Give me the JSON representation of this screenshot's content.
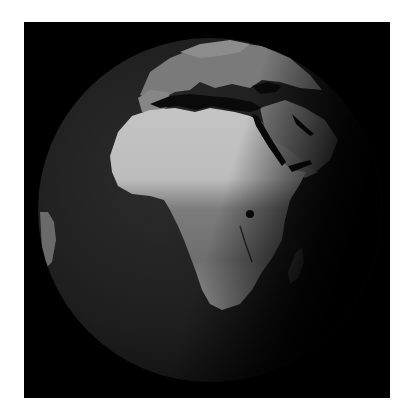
{
  "image": {
    "subject": "Earth globe viewed from space centered on Africa",
    "palette": {
      "background": "#ffffff",
      "space": "#000000",
      "ocean": "#1e1e1e",
      "land_light": "#c8c8c8",
      "land_mid": "#8a8a8a",
      "land_dark": "#5a5a5a"
    }
  }
}
